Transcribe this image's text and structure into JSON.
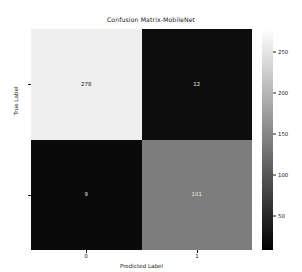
{
  "chart_data": {
    "type": "heatmap",
    "title": "Confusion Matrix-MobileNet",
    "xlabel": "Predicted Label",
    "ylabel": "True Label",
    "x_tick_labels": [
      "0",
      "1"
    ],
    "y_tick_labels": [
      "0",
      "1"
    ],
    "categories": [
      "0",
      "1"
    ],
    "matrix": [
      [
        278,
        12
      ],
      [
        9,
        101
      ]
    ],
    "cells": [
      {
        "row": "0",
        "col": "0",
        "value": "278",
        "text_color": "#1a1a1a",
        "fill": "#efefef"
      },
      {
        "row": "0",
        "col": "1",
        "value": "12",
        "text_color": "#e8e8e8",
        "fill": "#0d0d0d"
      },
      {
        "row": "1",
        "col": "0",
        "value": "9",
        "text_color": "#e8e8e8",
        "fill": "#0a0a0a"
      },
      {
        "row": "1",
        "col": "1",
        "value": "101",
        "text_color": "#e8e8e8",
        "fill": "#7d7d7d"
      }
    ],
    "colormap": "gray",
    "colorbar": {
      "ticks": [
        "250",
        "200",
        "150",
        "100",
        "50"
      ],
      "tick_values": [
        250,
        200,
        150,
        100,
        50
      ],
      "vmin": 9,
      "vmax": 278,
      "orientation": "vertical",
      "position": "right"
    },
    "grid": false,
    "legend": "none"
  }
}
